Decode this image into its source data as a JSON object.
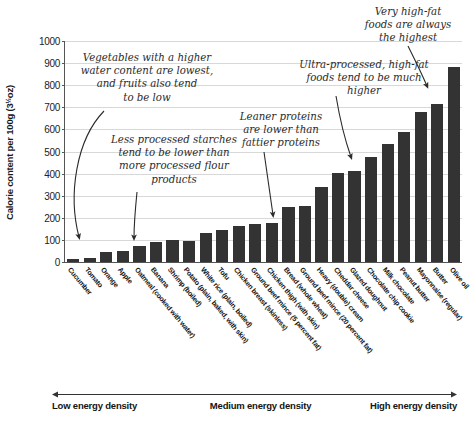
{
  "chart_data": {
    "type": "bar",
    "title": "",
    "subtitle": "",
    "xlabel": "",
    "ylabel": "Calorie content per 100g (3½oz)",
    "ylabel_main": "Calorie content per 100g (3",
    "ylabel_frac": "½",
    "ylabel_tail": "oz)",
    "ylim": [
      0,
      1000
    ],
    "ytick_values": [
      0,
      100,
      200,
      300,
      400,
      500,
      600,
      700,
      800,
      900,
      1000
    ],
    "ytick_labels": [
      "0",
      "100",
      "200",
      "300",
      "400",
      "500",
      "600",
      "700",
      "800",
      "900",
      "1000"
    ],
    "grid": true,
    "legend": "none",
    "bar_color": "#333333",
    "categories": [
      "Cucumber",
      "Tomato",
      "Orange",
      "Apple",
      "Oatmeal (cooked with water)",
      "Banana",
      "Shrimp (boiled)",
      "Potato (plain, baked, with skin)",
      "White rice (plain, boiled)",
      "Tofu",
      "Chicken breast (skinless)",
      "Ground beef mince (5 percent fat)",
      "Chicken thigh (with skin)",
      "Bread (whole wheat)",
      "Ground beef mince (20 percent fat)",
      "Heavy (double) cream",
      "Cheddar cheese",
      "Glazed doughnut",
      "Chocolate chip cookie",
      "Milk chocolate",
      "Peanut butter",
      "Mayonnaise (regular)",
      "Butter",
      "Olive oil"
    ],
    "values": [
      15,
      18,
      47,
      52,
      71,
      89,
      99,
      93,
      130,
      144,
      165,
      170,
      177,
      247,
      254,
      340,
      404,
      414,
      474,
      535,
      588,
      680,
      717,
      884
    ]
  },
  "annotations": [
    {
      "id": "vegetables",
      "text": "Vegetables with a higher\nwater content are lowest,\nand fruits also tend\nto be low"
    },
    {
      "id": "starches",
      "text": "Less processed starches\ntend to be lower than\nmore processed flour\nproducts"
    },
    {
      "id": "lean-proteins",
      "text": "Leaner proteins\nare lower than\nfattier proteins"
    },
    {
      "id": "ultra-processed",
      "text": "Ultra-processed, high-fat\nfoods tend to be much higher"
    },
    {
      "id": "high-fat",
      "text": "Very high-fat\nfoods are always\nthe highest"
    }
  ],
  "density_scale": {
    "low": "Low energy density",
    "medium": "Medium energy density",
    "high": "High energy density"
  }
}
